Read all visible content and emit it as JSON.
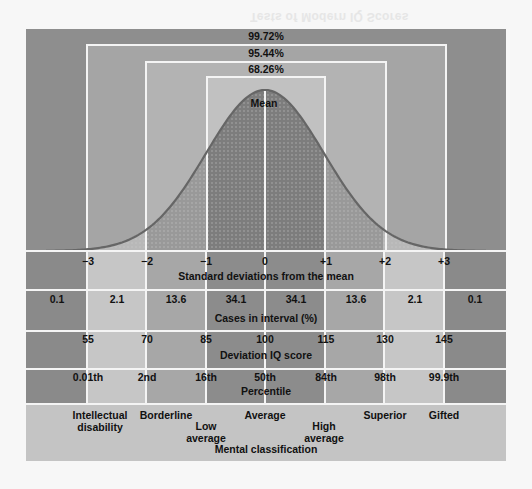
{
  "ghost_title": "Tests of Modern IQ Scores",
  "colors": {
    "page_bg": "#f7f7f7",
    "outer_bg": "#8e8e8e",
    "box1_bg": "#a5a5a5",
    "box2_bg": "#b3b3b3",
    "box3_bg": "#c1c1c1",
    "curve_center_fill": "#7d7d7d",
    "curve_mid_fill": "#999999",
    "curve_tail_fill": "#b8b8b8",
    "curve_stroke": "#666666",
    "col_outer": "#8a8a8a",
    "col_light": "#c6c6c6",
    "col_mid": "#a7a7a7",
    "col_dark": "#8c8c8c",
    "classification_bg": "#c4c4c4",
    "divider": "#f4f4f4"
  },
  "coverage": {
    "outer": "99.72%",
    "middle": "95.44%",
    "inner": "68.26%"
  },
  "mean_label": "Mean",
  "rows": {
    "sd": {
      "title": "Standard deviations from the mean",
      "ticks": [
        "−3",
        "−2",
        "−1",
        "0",
        "+1",
        "+2",
        "+3"
      ]
    },
    "cases": {
      "title": "Cases in interval (%)",
      "values": [
        "0.1",
        "2.1",
        "13.6",
        "34.1",
        "34.1",
        "13.6",
        "2.1",
        "0.1"
      ]
    },
    "iq": {
      "title": "Deviation IQ score",
      "ticks": [
        "55",
        "70",
        "85",
        "100",
        "115",
        "130",
        "145"
      ]
    },
    "percentile": {
      "title": "Percentile",
      "ticks": [
        "0.01th",
        "2nd",
        "16th",
        "50th",
        "84th",
        "98th",
        "99.9th"
      ]
    },
    "classification": {
      "title": "Mental classification",
      "labels": [
        {
          "line1": "Intellectual",
          "line2": "disability"
        },
        {
          "line1": "Borderline",
          "line2": ""
        },
        {
          "line1": "Low",
          "line2": "average"
        },
        {
          "line1": "Average",
          "line2": ""
        },
        {
          "line1": "High",
          "line2": "average"
        },
        {
          "line1": "Superior",
          "line2": ""
        },
        {
          "line1": "Gifted",
          "line2": ""
        }
      ]
    }
  },
  "chart_data": {
    "type": "area",
    "xlabel": "Standard deviations from the mean",
    "ylabel": "",
    "x": [
      -3,
      -2,
      -1,
      0,
      1,
      2,
      3
    ],
    "xlim": [
      -3.3,
      3.3
    ],
    "grid": false,
    "legend": "none",
    "annotations": [
      "Mean",
      "68.26%",
      "95.44%",
      "99.72%"
    ],
    "coverage_bands": [
      {
        "range": [
          -1,
          1
        ],
        "percent": 68.26
      },
      {
        "range": [
          -2,
          2
        ],
        "percent": 95.44
      },
      {
        "range": [
          -3,
          3
        ],
        "percent": 99.72
      }
    ],
    "intervals": [
      "< -3",
      "-3 to -2",
      "-2 to -1",
      "-1 to 0",
      "0 to +1",
      "+1 to +2",
      "+2 to +3",
      "> +3"
    ],
    "cases_in_interval_pct": [
      0.1,
      2.1,
      13.6,
      34.1,
      34.1,
      13.6,
      2.1,
      0.1
    ],
    "deviation_iq": [
      55,
      70,
      85,
      100,
      115,
      130,
      145
    ],
    "percentiles": [
      "0.01th",
      "2nd",
      "16th",
      "50th",
      "84th",
      "98th",
      "99.9th"
    ],
    "classifications": [
      "Intellectual disability",
      "Borderline",
      "Low average",
      "Average",
      "High average",
      "Superior",
      "Gifted"
    ]
  }
}
